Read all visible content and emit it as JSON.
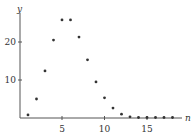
{
  "chart_data": {
    "type": "scatter",
    "title": "",
    "xlabel": "n",
    "ylabel": "y",
    "x": [
      1,
      2,
      3,
      4,
      5,
      6,
      7,
      8,
      9,
      10,
      11,
      12,
      13,
      14,
      15,
      16,
      17,
      18
    ],
    "values": [
      0.8,
      5,
      12.4,
      20.5,
      25.8,
      25.8,
      21.3,
      15.3,
      9.5,
      5.3,
      2.6,
      1.0,
      0.3,
      0.1,
      0.05,
      0.02,
      0.01,
      0.0
    ],
    "xticks": [
      5,
      10,
      15
    ],
    "yticks": [
      10,
      20
    ],
    "xlim": [
      0,
      19.5
    ],
    "ylim": [
      0,
      28
    ],
    "grid": false,
    "legend": null
  },
  "axes": {
    "x_label": "n",
    "y_label": "y",
    "x_tick_labels": [
      "5",
      "10",
      "15"
    ],
    "y_tick_labels": [
      "10",
      "20"
    ]
  },
  "colors": {
    "axis": "#555555",
    "point": "#333333",
    "text": "#333333"
  }
}
